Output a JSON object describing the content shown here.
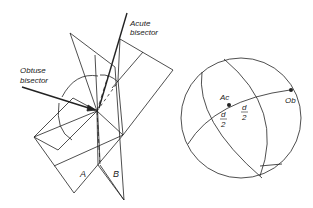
{
  "diagram": {
    "left_figure": {
      "labels": {
        "acute_line1": "Acute",
        "acute_line2": "bisector",
        "obtuse_line1": "Obtuse",
        "obtuse_line2": "bisector",
        "plane_a": "A",
        "plane_b": "B"
      }
    },
    "right_figure": {
      "labels": {
        "ac": "Ac",
        "ob": "Ob",
        "d1_num": "d",
        "d1_den": "2",
        "d2_num": "d",
        "d2_den": "2"
      }
    },
    "colors": {
      "line": "#222222",
      "background": "#ffffff"
    }
  }
}
